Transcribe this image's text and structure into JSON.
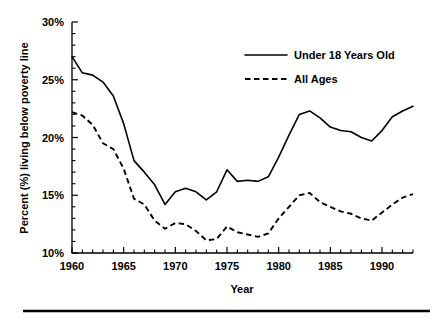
{
  "chart_data": {
    "type": "line",
    "title": "",
    "xlabel": "Year",
    "ylabel": "Percent (%) living below poverty line",
    "xlim": [
      1960,
      1993
    ],
    "ylim": [
      10,
      30
    ],
    "grid": false,
    "legend_position": "top-right",
    "x": [
      1960,
      1961,
      1962,
      1963,
      1964,
      1965,
      1966,
      1967,
      1968,
      1969,
      1970,
      1971,
      1972,
      1973,
      1974,
      1975,
      1976,
      1977,
      1978,
      1979,
      1980,
      1981,
      1982,
      1983,
      1984,
      1985,
      1986,
      1987,
      1988,
      1989,
      1990,
      1991,
      1992,
      1993
    ],
    "xticks": [
      1960,
      1965,
      1970,
      1975,
      1980,
      1985,
      1990
    ],
    "xticklabels": [
      "1960",
      "1965",
      "1970",
      "1975",
      "1980",
      "1985",
      "1990"
    ],
    "xminortick_interval": 1,
    "yticks": [
      10,
      15,
      20,
      25,
      30
    ],
    "yticklabels": [
      "10%",
      "15%",
      "20%",
      "25%",
      "30%"
    ],
    "yminortick_interval": 1,
    "series": [
      {
        "name": "Under 18 Years Old",
        "style": "solid",
        "values": [
          27.0,
          25.6,
          25.4,
          24.8,
          23.6,
          21.2,
          18.0,
          17.0,
          15.9,
          14.2,
          15.3,
          15.6,
          15.3,
          14.6,
          15.3,
          17.2,
          16.2,
          16.3,
          16.2,
          16.6,
          18.3,
          20.2,
          22.0,
          22.3,
          21.7,
          20.9,
          20.6,
          20.5,
          20.0,
          19.7,
          20.6,
          21.8,
          22.3,
          22.7
        ]
      },
      {
        "name": "All Ages",
        "style": "dashed",
        "values": [
          22.2,
          21.9,
          21.1,
          19.5,
          19.0,
          17.3,
          14.7,
          14.2,
          12.8,
          12.1,
          12.6,
          12.5,
          11.9,
          11.1,
          11.2,
          12.3,
          11.8,
          11.6,
          11.4,
          11.7,
          13.0,
          14.0,
          15.0,
          15.2,
          14.4,
          14.0,
          13.6,
          13.4,
          13.0,
          12.8,
          13.5,
          14.2,
          14.8,
          15.1
        ]
      }
    ]
  },
  "legend": {
    "items": [
      {
        "label": "Under 18 Years Old",
        "style": "solid"
      },
      {
        "label": "All Ages",
        "style": "dashed"
      }
    ]
  },
  "axes": {
    "x_title": "Year",
    "y_title": "Percent (%) living below poverty line"
  }
}
